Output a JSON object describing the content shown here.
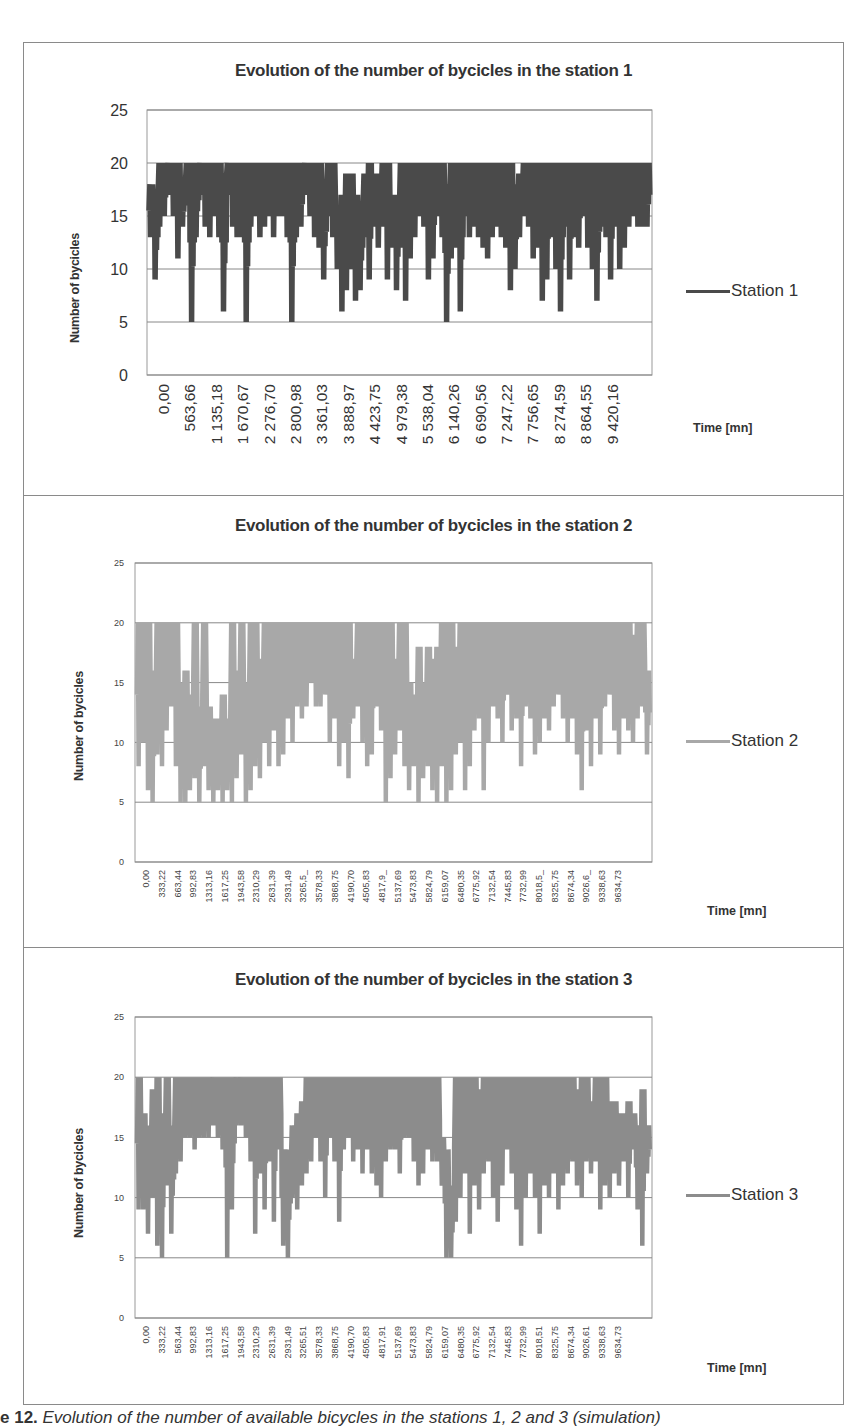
{
  "chart_data": [
    {
      "type": "line",
      "title": "Evolution of the number of bycicles in the station 1",
      "xlabel": "Time [mn]",
      "ylabel": "Number of bycicles",
      "ylim": [
        0,
        25
      ],
      "yticks": [
        "0",
        "5",
        "10",
        "15",
        "20",
        "25"
      ],
      "grid": true,
      "legend_position": "right",
      "color": "#4a4a4a",
      "xtick_labels": [
        "0,00",
        "563,66",
        "1 135,18",
        "1 670,67",
        "2 276,70",
        "2 800,98",
        "3 361,03",
        "3 888,97",
        "4 423,75",
        "4 979,38",
        "5 538,04",
        "6 140,26",
        "6 690,56",
        "7 247,22",
        "7 756,65",
        "8 274,59",
        "8 864,55",
        "9 420,16"
      ],
      "series": [
        {
          "name": "Station 1",
          "x_range": [
            0,
            9900
          ],
          "envelope_min": [
            13,
            9,
            14,
            15,
            17,
            15,
            11,
            14,
            16,
            5,
            13,
            17,
            14,
            13,
            15,
            13,
            6,
            17,
            14,
            13,
            13,
            5,
            14,
            15,
            13,
            14,
            15,
            13,
            15,
            15,
            13,
            5,
            13,
            14,
            17,
            15,
            13,
            12,
            9,
            15,
            13,
            10,
            6,
            8,
            10,
            7,
            8,
            13,
            9,
            14,
            12,
            14,
            9,
            12,
            8,
            12,
            7,
            11,
            13,
            15,
            14,
            9,
            11,
            15,
            13,
            5,
            11,
            12,
            6,
            15,
            13,
            14,
            13,
            12,
            11,
            13,
            14,
            13,
            12,
            8,
            10,
            13,
            15,
            14,
            11,
            12,
            7,
            9,
            13,
            10,
            6,
            14,
            9,
            13,
            12,
            15,
            12,
            10,
            7,
            14,
            13,
            9,
            14,
            10,
            12,
            14,
            15,
            14,
            14,
            14
          ],
          "envelope_max": [
            18,
            17,
            20,
            20,
            20,
            20,
            20,
            18,
            20,
            20,
            20,
            20,
            20,
            20,
            20,
            20,
            19,
            20,
            20,
            20,
            20,
            20,
            20,
            20,
            20,
            20,
            20,
            20,
            20,
            20,
            20,
            20,
            20,
            20,
            20,
            20,
            20,
            20,
            18,
            20,
            20,
            16,
            17,
            19,
            19,
            17,
            16,
            19,
            20,
            19,
            19,
            20,
            20,
            17,
            17,
            20,
            20,
            20,
            20,
            20,
            20,
            20,
            20,
            20,
            20,
            18,
            20,
            20,
            20,
            20,
            20,
            20,
            20,
            20,
            20,
            20,
            20,
            20,
            20,
            20,
            18,
            19,
            20,
            20,
            20,
            20,
            20,
            20,
            20,
            20,
            20,
            20,
            20,
            20,
            20,
            20,
            20,
            20,
            20,
            20,
            20,
            20,
            20,
            20,
            20,
            20,
            20,
            20,
            20,
            20
          ]
        }
      ]
    },
    {
      "type": "line",
      "title": "Evolution of the number of bycicles in the station 2",
      "xlabel": "Time [mn]",
      "ylabel": "Number of bycicles",
      "ylim": [
        0,
        25
      ],
      "yticks": [
        "0",
        "5",
        "10",
        "15",
        "20",
        "25"
      ],
      "grid": true,
      "legend_position": "right",
      "color": "#a8a8a8",
      "xtick_labels": [
        "0,00",
        "333,22",
        "663,44",
        "992,83",
        "1313,16",
        "1617,25",
        "1943,58",
        "2310,29",
        "2631,39",
        "2931,49",
        "3265,5_",
        "3578,33",
        "3868,75",
        "4190,70",
        "4505,83",
        "4817,9_",
        "5137,69",
        "5473,83",
        "5824,79",
        "6159,07",
        "6480,35",
        "6775,92",
        "7132,54",
        "7445,83",
        "7732,99",
        "8018,5_",
        "8325,75",
        "8674,34",
        "9026,6_",
        "9338,63",
        "9634,73"
      ],
      "series": [
        {
          "name": "Station 2",
          "x_range": [
            0,
            9900
          ],
          "envelope_min": [
            8,
            10,
            6,
            5,
            9,
            8,
            11,
            13,
            8,
            5,
            5,
            6,
            7,
            5,
            8,
            6,
            5,
            6,
            5,
            6,
            5,
            7,
            9,
            5,
            6,
            8,
            7,
            10,
            8,
            11,
            8,
            9,
            12,
            10,
            13,
            12,
            13,
            15,
            13,
            13,
            14,
            10,
            12,
            8,
            10,
            7,
            12,
            13,
            10,
            8,
            9,
            13,
            11,
            5,
            7,
            9,
            11,
            8,
            6,
            8,
            5,
            7,
            8,
            6,
            5,
            8,
            5,
            6,
            9,
            10,
            6,
            8,
            11,
            12,
            6,
            10,
            13,
            12,
            10,
            14,
            11,
            12,
            8,
            13,
            12,
            9,
            10,
            12,
            11,
            13,
            14,
            12,
            10,
            12,
            9,
            6,
            11,
            8,
            12,
            9,
            13,
            14,
            11,
            9,
            12,
            11,
            10,
            12,
            13,
            9
          ],
          "envelope_max": [
            20,
            20,
            20,
            16,
            20,
            20,
            20,
            20,
            20,
            15,
            16,
            14,
            20,
            13,
            20,
            13,
            12,
            12,
            14,
            12,
            20,
            16,
            20,
            15,
            20,
            20,
            17,
            20,
            20,
            20,
            20,
            20,
            20,
            20,
            20,
            20,
            20,
            20,
            20,
            20,
            20,
            20,
            20,
            20,
            20,
            20,
            17,
            20,
            20,
            20,
            20,
            20,
            20,
            20,
            20,
            17,
            20,
            20,
            15,
            14,
            18,
            15,
            18,
            17,
            18,
            20,
            20,
            20,
            18,
            20,
            20,
            20,
            20,
            20,
            20,
            20,
            20,
            20,
            20,
            20,
            20,
            20,
            20,
            20,
            20,
            20,
            20,
            20,
            20,
            20,
            20,
            20,
            20,
            20,
            20,
            20,
            20,
            20,
            20,
            20,
            20,
            20,
            20,
            20,
            20,
            20,
            19,
            20,
            20,
            16
          ]
        }
      ]
    },
    {
      "type": "line",
      "title": "Evolution of the number of bycicles in the station 3",
      "xlabel": "Time [mn]",
      "ylabel": "Number of bycicles",
      "ylim": [
        0,
        25
      ],
      "yticks": [
        "0",
        "5",
        "10",
        "15",
        "20",
        "25"
      ],
      "grid": true,
      "legend_position": "right",
      "color": "#8c8c8c",
      "xtick_labels": [
        "0,00",
        "333,22",
        "563,44",
        "992,83",
        "1313,16",
        "1617,25",
        "1943,58",
        "2310,29",
        "2631,39",
        "2931,49",
        "3265,51",
        "3578,33",
        "3868,75",
        "4190,70",
        "4505,83",
        "4817,91",
        "5137,69",
        "5473,83",
        "5824,79",
        "6159,07",
        "6480,35",
        "6775,92",
        "7132,54",
        "7445,83",
        "7732,99",
        "8018,51",
        "8325,75",
        "8674,34",
        "9026,61",
        "9338,63",
        "9634,73"
      ],
      "series": [
        {
          "name": "Station 3",
          "x_range": [
            0,
            9900
          ],
          "envelope_min": [
            9,
            9,
            7,
            10,
            6,
            5,
            11,
            7,
            12,
            13,
            15,
            15,
            14,
            15,
            15,
            15,
            16,
            15,
            14,
            5,
            9,
            16,
            16,
            15,
            13,
            7,
            12,
            9,
            13,
            8,
            14,
            6,
            5,
            10,
            9,
            11,
            12,
            13,
            15,
            13,
            10,
            15,
            13,
            8,
            14,
            15,
            13,
            14,
            12,
            14,
            12,
            11,
            10,
            13,
            14,
            14,
            12,
            15,
            15,
            13,
            11,
            12,
            14,
            13,
            13,
            11,
            5,
            5,
            8,
            10,
            12,
            7,
            11,
            9,
            12,
            13,
            10,
            8,
            11,
            14,
            12,
            9,
            6,
            10,
            12,
            10,
            7,
            11,
            10,
            12,
            9,
            11,
            12,
            13,
            11,
            10,
            13,
            12,
            13,
            9,
            11,
            10,
            12,
            11,
            13,
            10,
            14,
            9,
            6,
            12
          ],
          "envelope_max": [
            20,
            17,
            16,
            19,
            20,
            17,
            20,
            16,
            20,
            20,
            20,
            20,
            20,
            20,
            20,
            20,
            20,
            20,
            20,
            20,
            20,
            20,
            20,
            20,
            20,
            20,
            20,
            20,
            20,
            20,
            20,
            14,
            14,
            16,
            17,
            18,
            20,
            20,
            20,
            20,
            20,
            20,
            20,
            20,
            20,
            20,
            20,
            20,
            20,
            20,
            20,
            20,
            20,
            20,
            20,
            20,
            20,
            20,
            20,
            20,
            20,
            20,
            20,
            20,
            20,
            15,
            14,
            11,
            20,
            20,
            20,
            20,
            20,
            19,
            20,
            20,
            20,
            20,
            20,
            20,
            20,
            20,
            20,
            20,
            20,
            20,
            20,
            20,
            20,
            20,
            20,
            20,
            20,
            20,
            19,
            20,
            20,
            18,
            20,
            20,
            20,
            18,
            18,
            17,
            17,
            18,
            17,
            16,
            19,
            16
          ]
        }
      ]
    }
  ],
  "panels": [
    {
      "title": "Evolution of the number of bycicles in the station 1",
      "ylabel": "Number of bycicles",
      "legend_label": "Station 1",
      "time_label": "Time [mn]"
    },
    {
      "title": "Evolution of the number of bycicles in the station 2",
      "ylabel": "Number of bycicles",
      "legend_label": "Station 2",
      "time_label": "Time [mn]"
    },
    {
      "title": "Evolution of the number of bycicles in the station 3",
      "ylabel": "Number of bycicles",
      "legend_label": "Station 3",
      "time_label": "Time [mn]"
    }
  ],
  "caption": {
    "prefix": "e 12.",
    "text": " Evolution of the number of available bicycles in the stations 1, 2 and 3 (simulation)"
  }
}
